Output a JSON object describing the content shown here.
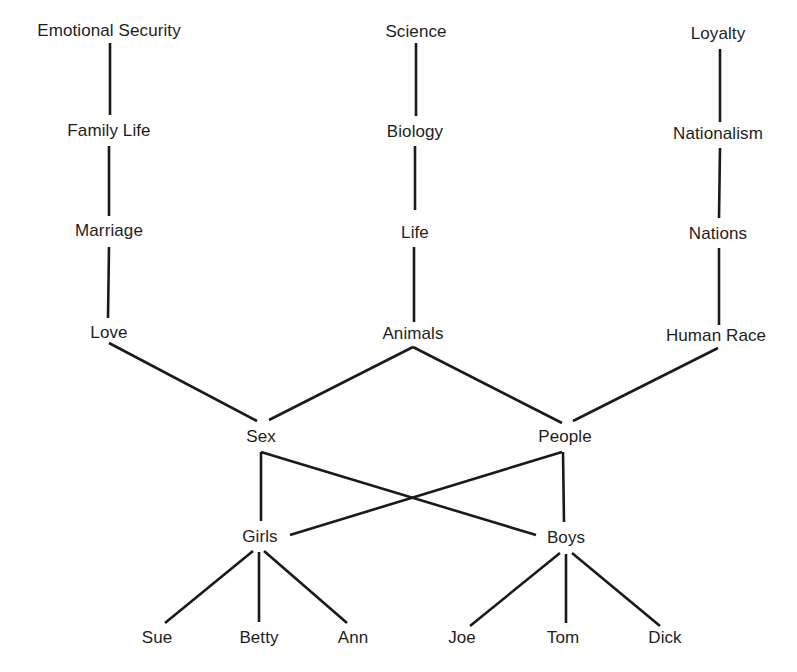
{
  "diagram": {
    "type": "abstraction-ladder",
    "colors": {
      "background": "#ffffff",
      "ink": "#1e1e1e"
    },
    "nodes": [
      {
        "id": "emotional_security",
        "label": "Emotional Security",
        "x": 109,
        "y": 30
      },
      {
        "id": "family_life",
        "label": "Family Life",
        "x": 109,
        "y": 130
      },
      {
        "id": "marriage",
        "label": "Marriage",
        "x": 109,
        "y": 230
      },
      {
        "id": "love",
        "label": "Love",
        "x": 109,
        "y": 332
      },
      {
        "id": "science",
        "label": "Science",
        "x": 416,
        "y": 31
      },
      {
        "id": "biology",
        "label": "Biology",
        "x": 415,
        "y": 131
      },
      {
        "id": "life",
        "label": "Life",
        "x": 415,
        "y": 232
      },
      {
        "id": "animals",
        "label": "Animals",
        "x": 413,
        "y": 333
      },
      {
        "id": "loyalty",
        "label": "Loyalty",
        "x": 718,
        "y": 33
      },
      {
        "id": "nationalism",
        "label": "Nationalism",
        "x": 718,
        "y": 133
      },
      {
        "id": "nations",
        "label": "Nations",
        "x": 718,
        "y": 233
      },
      {
        "id": "human_race",
        "label": "Human Race",
        "x": 716,
        "y": 335
      },
      {
        "id": "sex",
        "label": "Sex",
        "x": 261,
        "y": 436
      },
      {
        "id": "people",
        "label": "People",
        "x": 565,
        "y": 436
      },
      {
        "id": "girls",
        "label": "Girls",
        "x": 260,
        "y": 536
      },
      {
        "id": "boys",
        "label": "Boys",
        "x": 566,
        "y": 537
      },
      {
        "id": "sue",
        "label": "Sue",
        "x": 157,
        "y": 637
      },
      {
        "id": "betty",
        "label": "Betty",
        "x": 259,
        "y": 637
      },
      {
        "id": "ann",
        "label": "Ann",
        "x": 353,
        "y": 637
      },
      {
        "id": "joe",
        "label": "Joe",
        "x": 462,
        "y": 637
      },
      {
        "id": "tom",
        "label": "Tom",
        "x": 563,
        "y": 637
      },
      {
        "id": "dick",
        "label": "Dick",
        "x": 665,
        "y": 637
      }
    ],
    "edges": [
      {
        "from": "emotional_security",
        "to": "family_life",
        "x1": 110,
        "y1": 43,
        "x2": 110,
        "y2": 115
      },
      {
        "from": "family_life",
        "to": "marriage",
        "x1": 109,
        "y1": 146,
        "x2": 109,
        "y2": 216
      },
      {
        "from": "marriage",
        "to": "love",
        "x1": 109,
        "y1": 247,
        "x2": 108,
        "y2": 318
      },
      {
        "from": "love",
        "to": "sex",
        "x1": 109,
        "y1": 343,
        "x2": 257,
        "y2": 421
      },
      {
        "from": "science",
        "to": "biology",
        "x1": 416,
        "y1": 43,
        "x2": 416,
        "y2": 116
      },
      {
        "from": "biology",
        "to": "life",
        "x1": 415,
        "y1": 146,
        "x2": 415,
        "y2": 210
      },
      {
        "from": "life",
        "to": "animals",
        "x1": 414,
        "y1": 247,
        "x2": 414,
        "y2": 322
      },
      {
        "from": "animals",
        "to": "sex",
        "x1": 413,
        "y1": 347,
        "x2": 269,
        "y2": 420
      },
      {
        "from": "animals",
        "to": "people",
        "x1": 413,
        "y1": 347,
        "x2": 562,
        "y2": 423
      },
      {
        "from": "loyalty",
        "to": "nationalism",
        "x1": 720,
        "y1": 49,
        "x2": 720,
        "y2": 122
      },
      {
        "from": "nationalism",
        "to": "nations",
        "x1": 720,
        "y1": 148,
        "x2": 719,
        "y2": 218
      },
      {
        "from": "nations",
        "to": "human_race",
        "x1": 719,
        "y1": 248,
        "x2": 719,
        "y2": 325
      },
      {
        "from": "human_race",
        "to": "people",
        "x1": 718,
        "y1": 348,
        "x2": 573,
        "y2": 421
      },
      {
        "from": "sex",
        "to": "girls",
        "x1": 261,
        "y1": 452,
        "x2": 261,
        "y2": 521
      },
      {
        "from": "sex",
        "to": "boys",
        "x1": 261,
        "y1": 452,
        "x2": 536,
        "y2": 535
      },
      {
        "from": "people",
        "to": "girls",
        "x1": 562,
        "y1": 452,
        "x2": 290,
        "y2": 535
      },
      {
        "from": "people",
        "to": "boys",
        "x1": 563,
        "y1": 452,
        "x2": 564,
        "y2": 522
      },
      {
        "from": "girls",
        "to": "sue",
        "x1": 253,
        "y1": 551,
        "x2": 165,
        "y2": 623
      },
      {
        "from": "girls",
        "to": "betty",
        "x1": 259,
        "y1": 552,
        "x2": 259,
        "y2": 622
      },
      {
        "from": "girls",
        "to": "ann",
        "x1": 264,
        "y1": 551,
        "x2": 347,
        "y2": 623
      },
      {
        "from": "boys",
        "to": "joe",
        "x1": 560,
        "y1": 553,
        "x2": 470,
        "y2": 626
      },
      {
        "from": "boys",
        "to": "tom",
        "x1": 566,
        "y1": 554,
        "x2": 566,
        "y2": 623
      },
      {
        "from": "boys",
        "to": "dick",
        "x1": 572,
        "y1": 553,
        "x2": 660,
        "y2": 626
      }
    ]
  }
}
